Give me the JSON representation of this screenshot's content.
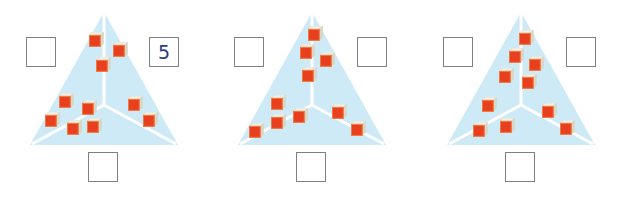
{
  "worksheet": {
    "type": "number-bond-triangle-worksheet",
    "description": "Three shaded triangles divided into three regions each, filled with small red cubes; empty answer boxes beside and below each triangle.",
    "colors": {
      "triangle_fill": "#cdeaf6",
      "triangle_divider": "#ffffff",
      "cube_front": "#e8401f",
      "cube_top": "#f2f0e4",
      "cube_side": "#d9d6c4",
      "cube_outline": "#f07a40",
      "box_border": "#7b7f86",
      "answer_text": "#2a3a86",
      "page_background": "#ffffff"
    }
  },
  "puzzles": [
    {
      "id": "puzzle-1",
      "left_x": 0,
      "boxes": {
        "left": {
          "value": "",
          "filled": false
        },
        "right": {
          "value": "5",
          "filled": true
        },
        "bottom": {
          "value": "",
          "filled": false
        }
      },
      "regions": {
        "top": {
          "count": 3
        },
        "bottom_left": {
          "count": 5
        },
        "bottom_right": {
          "count": 2
        }
      },
      "total": 10,
      "cubes": {
        "top": [
          {
            "x": 89,
            "y": 32
          },
          {
            "x": 113,
            "y": 42
          },
          {
            "x": 96,
            "y": 57
          }
        ],
        "bottom_left": [
          {
            "x": 59,
            "y": 93
          },
          {
            "x": 82,
            "y": 100
          },
          {
            "x": 45,
            "y": 112
          },
          {
            "x": 67,
            "y": 120
          },
          {
            "x": 87,
            "y": 118
          }
        ],
        "bottom_right": [
          {
            "x": 128,
            "y": 96
          },
          {
            "x": 143,
            "y": 112
          }
        ]
      }
    },
    {
      "id": "puzzle-2",
      "left_x": 208,
      "boxes": {
        "left": {
          "value": "",
          "filled": false
        },
        "right": {
          "value": "",
          "filled": false
        },
        "bottom": {
          "value": "",
          "filled": false
        }
      },
      "regions": {
        "top": {
          "count": 4
        },
        "bottom_left": {
          "count": 4
        },
        "bottom_right": {
          "count": 2
        }
      },
      "total": 10,
      "cubes": {
        "top": [
          {
            "x": 100,
            "y": 26
          },
          {
            "x": 92,
            "y": 44
          },
          {
            "x": 112,
            "y": 52
          },
          {
            "x": 94,
            "y": 67
          }
        ],
        "bottom_left": [
          {
            "x": 63,
            "y": 95
          },
          {
            "x": 85,
            "y": 108
          },
          {
            "x": 63,
            "y": 114
          },
          {
            "x": 41,
            "y": 123
          }
        ],
        "bottom_right": [
          {
            "x": 124,
            "y": 104
          },
          {
            "x": 143,
            "y": 121
          }
        ]
      }
    },
    {
      "id": "puzzle-3",
      "left_x": 417,
      "boxes": {
        "left": {
          "value": "",
          "filled": false
        },
        "right": {
          "value": "",
          "filled": false
        },
        "bottom": {
          "value": "",
          "filled": false
        }
      },
      "regions": {
        "top": {
          "count": 5
        },
        "bottom_left": {
          "count": 3
        },
        "bottom_right": {
          "count": 2
        }
      },
      "total": 10,
      "cubes": {
        "top": [
          {
            "x": 102,
            "y": 30
          },
          {
            "x": 92,
            "y": 48
          },
          {
            "x": 112,
            "y": 56
          },
          {
            "x": 82,
            "y": 68
          },
          {
            "x": 105,
            "y": 74
          }
        ],
        "bottom_left": [
          {
            "x": 65,
            "y": 97
          },
          {
            "x": 83,
            "y": 118
          },
          {
            "x": 56,
            "y": 122
          }
        ],
        "bottom_right": [
          {
            "x": 125,
            "y": 103
          },
          {
            "x": 143,
            "y": 120
          }
        ]
      }
    }
  ]
}
